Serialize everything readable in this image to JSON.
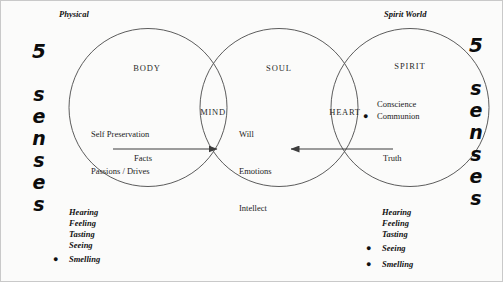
{
  "diagram": {
    "headings": {
      "left": "Physical",
      "right": "Spirit World"
    },
    "side_labels": {
      "left": [
        "5",
        "s",
        "e",
        "n",
        "s",
        "e",
        "s"
      ],
      "right": [
        "5",
        "s",
        "e",
        "n",
        "s",
        "e",
        "s"
      ]
    },
    "circles": [
      {
        "id": "body",
        "title": "BODY",
        "lines": [
          "Self Preservation",
          "Passions / Drives"
        ]
      },
      {
        "id": "soul",
        "title": "SOUL",
        "lines": [
          "Will",
          "Emotions",
          "Intellect"
        ]
      },
      {
        "id": "spirit",
        "title": "SPIRIT",
        "items": [
          {
            "label": "Conscience",
            "bullet": false
          },
          {
            "label": "Communion",
            "bullet": true
          }
        ]
      }
    ],
    "overlaps": [
      {
        "id": "mind",
        "label": "MIND"
      },
      {
        "id": "heart",
        "label": "HEART"
      }
    ],
    "flows": [
      {
        "id": "facts",
        "label": "Facts",
        "direction": "right"
      },
      {
        "id": "truth",
        "label": "Truth",
        "direction": "left"
      }
    ],
    "sense_lists": {
      "left": [
        {
          "label": "Hearing",
          "bullet": false
        },
        {
          "label": "Feeling",
          "bullet": false
        },
        {
          "label": "Tasting",
          "bullet": false
        },
        {
          "label": "Seeing",
          "bullet": false
        },
        {
          "label": "Smelling",
          "bullet": true
        }
      ],
      "right": [
        {
          "label": "Hearing",
          "bullet": false
        },
        {
          "label": "Feeling",
          "bullet": false
        },
        {
          "label": "Tasting",
          "bullet": false
        },
        {
          "label": "Seeing",
          "bullet": true
        },
        {
          "label": "Smelling",
          "bullet": true
        }
      ]
    },
    "colors": {
      "stroke": "#4a4a4a",
      "text": "#1a1a1a",
      "background": "#fbfbfa"
    }
  }
}
